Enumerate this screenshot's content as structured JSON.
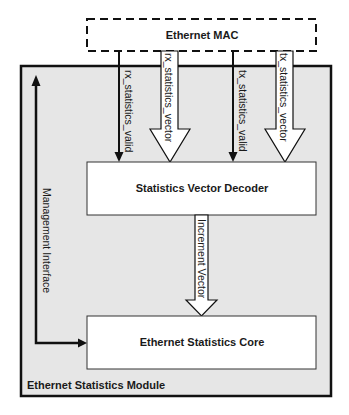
{
  "diagram": {
    "colors": {
      "module_fill": "#e6e6e6",
      "block_fill": "#ffffff",
      "stroke": "#111111",
      "text": "#1a1a1a"
    },
    "nodes": {
      "ethernet_mac": {
        "label": "Ethernet MAC",
        "style": "dashed"
      },
      "module": {
        "label": "Ethernet Statistics Module"
      },
      "decoder": {
        "label": "Statistics Vector Decoder"
      },
      "core": {
        "label": "Ethernet Statistics Core"
      }
    },
    "edges": {
      "rx_valid": {
        "label": "rx_statistics_valid",
        "from": "Ethernet MAC",
        "to": "Statistics Vector Decoder",
        "style": "thin-arrow"
      },
      "rx_vector": {
        "label": "rx_statistics_vector",
        "from": "Ethernet MAC",
        "to": "Statistics Vector Decoder",
        "style": "hollow-arrow"
      },
      "tx_valid": {
        "label": "tx_statistics_valid",
        "from": "Ethernet MAC",
        "to": "Statistics Vector Decoder",
        "style": "thin-arrow"
      },
      "tx_vector": {
        "label": "tx_statistics_vector",
        "from": "Ethernet MAC",
        "to": "Statistics Vector Decoder",
        "style": "hollow-arrow"
      },
      "increment": {
        "label": "Increment Vector",
        "from": "Statistics Vector Decoder",
        "to": "Ethernet Statistics Core",
        "style": "hollow-arrow"
      },
      "management": {
        "label": "Management Interface",
        "from": "Ethernet Statistics Core",
        "to": "external",
        "style": "bidirectional-thick"
      }
    }
  }
}
